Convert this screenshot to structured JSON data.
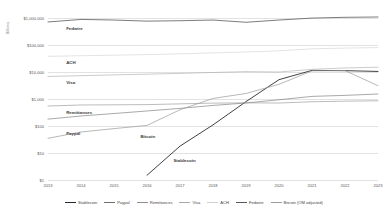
{
  "chart_data": {
    "type": "line",
    "title": "",
    "xlabel": "",
    "ylabel": "Billions",
    "yscale": "log",
    "ylim": [
      1,
      1000000
    ],
    "grid": true,
    "legend_position": "bottom",
    "categories": [
      "2013",
      "2014",
      "2015",
      "2016",
      "2017",
      "2018",
      "2019",
      "2020",
      "2021",
      "2022",
      "2023"
    ],
    "ytick_labels": [
      "$1,000,000",
      "$100,000",
      "$10,000",
      "$1,000",
      "$100",
      "$10",
      "$1"
    ],
    "ytick_values": [
      1000000,
      100000,
      10000,
      1000,
      100,
      10,
      1
    ],
    "series": [
      {
        "name": "Stablecoin",
        "color": "#2b2b2b",
        "width": 0.9,
        "values": [
          null,
          null,
          null,
          1.5,
          18,
          110,
          800,
          5200,
          11500,
          11200,
          10500
        ]
      },
      {
        "name": "Paypal",
        "color": "#6e6e6e",
        "width": 0.6,
        "values": [
          180,
          235,
          290,
          360,
          450,
          578,
          712,
          936,
          1250,
          1360,
          1530
        ]
      },
      {
        "name": "Remittances",
        "color": "#8f8f8f",
        "width": 0.6,
        "values": [
          550,
          600,
          610,
          620,
          660,
          705,
          720,
          710,
          790,
          830,
          860
        ]
      },
      {
        "name": "Visa",
        "color": "#a8a8a8",
        "width": 0.6,
        "values": [
          6800,
          7300,
          7800,
          8300,
          8900,
          9600,
          10300,
          10000,
          12500,
          14100,
          15000
        ]
      },
      {
        "name": "ACH",
        "color": "#d0d0d0",
        "width": 0.6,
        "values": [
          38000,
          40000,
          42000,
          44000,
          47000,
          51000,
          55000,
          61000,
          72000,
          77000,
          80000
        ]
      },
      {
        "name": "Fedwire",
        "color": "#5a5a5a",
        "width": 0.8,
        "values": [
          713000,
          885000,
          840000,
          766000,
          792000,
          840000,
          695000,
          840000,
          992000,
          1060000,
          1090000
        ]
      },
      {
        "name": "Bitcoin (OM adjusted)",
        "color": "#9a9a9a",
        "width": 0.7,
        "values": [
          35,
          60,
          80,
          105,
          400,
          1050,
          1600,
          3500,
          11000,
          11300,
          3100
        ]
      }
    ],
    "inline_annotations": [
      {
        "text": "Fedwire",
        "x_pct": 5.5,
        "y_value": 430000
      },
      {
        "text": "ACH",
        "x_pct": 5.5,
        "y_value": 23000
      },
      {
        "text": "Visa",
        "x_pct": 5.5,
        "y_value": 4300
      },
      {
        "text": "Remittances",
        "x_pct": 5.5,
        "y_value": 340
      },
      {
        "text": "Paypal",
        "x_pct": 5.5,
        "y_value": 56
      },
      {
        "text": "Bitcoin",
        "x_pct": 28,
        "y_value": 41
      },
      {
        "text": "Stablecoin",
        "x_pct": 38,
        "y_value": 5.5
      }
    ]
  }
}
